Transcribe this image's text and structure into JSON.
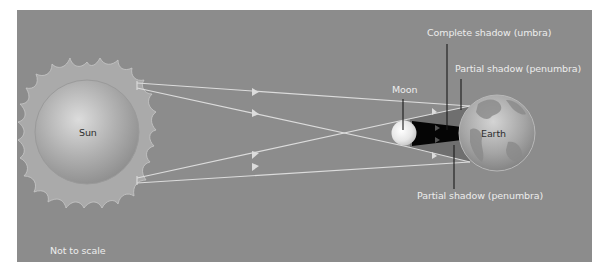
{
  "diagram": {
    "type": "solar-eclipse-geometry",
    "colors": {
      "background": "#8c8c8c",
      "ray": "#dcdcdc",
      "umbra": "#050505",
      "penumbra": "#6f6f6f",
      "label_text": "#ececec",
      "leader_line": "#1a1a1a"
    },
    "bodies": {
      "sun": {
        "label": "Sun"
      },
      "moon": {
        "label": "Moon"
      },
      "earth": {
        "label": "Earth"
      }
    },
    "annotations": {
      "umbra": "Complete shadow (umbra)",
      "penumbra_top": "Partial shadow (penumbra)",
      "penumbra_bottom": "Partial shadow (penumbra)",
      "scale_note": "Not to scale"
    }
  }
}
